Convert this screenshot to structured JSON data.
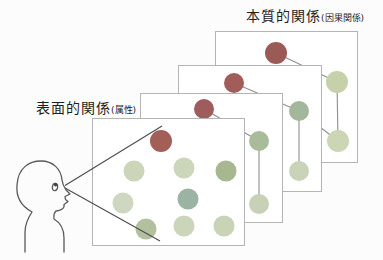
{
  "labels": {
    "back_title": "本質的関係",
    "back_title_note": "(因果関係)",
    "front_title": "表面的関係",
    "front_title_note": "(属性)"
  },
  "colors": {
    "background": "#fcfcfc",
    "card_bg": "#ffffff",
    "card_border": "#b4b4b4",
    "edge": "#8f8f8f",
    "cone": "#4f4f4f",
    "person_outline": "#5a5a5a",
    "text": "#1e1e1e",
    "node_dark_red": "#a25f58",
    "node_light_green": "#cbd5b9",
    "node_medium_green": "#a8bc99",
    "node_teal_green": "#9bb3a3"
  },
  "diagram": {
    "cards": [
      {
        "id": 4,
        "role": "deep-relations-card-back",
        "x": 215,
        "y": 31,
        "w": 143,
        "h": 132,
        "z": 1,
        "edges": [
          [
            60,
            21,
            121,
            50
          ],
          [
            121,
            50,
            122,
            109
          ],
          [
            104,
            95,
            122,
            109
          ]
        ],
        "dots": [
          [
            60,
            21,
            11,
            "#9a5a55"
          ],
          [
            121,
            50,
            11,
            "#c6d1ab"
          ],
          [
            122,
            109,
            11,
            "#ccd6b4"
          ]
        ]
      },
      {
        "id": 3,
        "role": "deep-relations-card",
        "x": 178,
        "y": 65,
        "w": 144,
        "h": 127,
        "z": 2,
        "edges": [
          [
            55,
            17,
            120,
            45
          ],
          [
            120,
            45,
            120,
            105
          ]
        ],
        "dots": [
          [
            55,
            17,
            10,
            "#a25d5a"
          ],
          [
            120,
            45,
            10,
            "#a3b79c"
          ],
          [
            120,
            105,
            10,
            "#c9d3b8"
          ]
        ]
      },
      {
        "id": 2,
        "role": "deep-relations-card",
        "x": 140,
        "y": 93,
        "w": 143,
        "h": 130,
        "z": 3,
        "edges": [
          [
            63,
            15,
            118,
            47
          ],
          [
            118,
            47,
            118,
            110
          ]
        ],
        "dots": [
          [
            63,
            15,
            10,
            "#9e5c5c"
          ],
          [
            118,
            47,
            10,
            "#a8bc99"
          ],
          [
            118,
            110,
            10,
            "#c6d1b6"
          ]
        ]
      },
      {
        "id": 1,
        "role": "surface-relations-card-front",
        "x": 92,
        "y": 118,
        "w": 153,
        "h": 128,
        "z": 4,
        "edges": [],
        "dots": [
          [
            68,
            22,
            11,
            "#a25f58"
          ],
          [
            41,
            52,
            10.5,
            "#cbd5b9"
          ],
          [
            91,
            49,
            10.5,
            "#ccd6bb"
          ],
          [
            133,
            52,
            10.5,
            "#a7b790"
          ],
          [
            30,
            84,
            10.5,
            "#ced8c0"
          ],
          [
            95,
            80,
            10.5,
            "#9bb3a3"
          ],
          [
            53,
            110,
            10.5,
            "#b2c09e"
          ],
          [
            91,
            107,
            10.5,
            "#cbd5b9"
          ],
          [
            131,
            107,
            10.5,
            "#c9d4b6"
          ]
        ]
      }
    ],
    "view_cone": {
      "lines": [
        [
          65,
          185.5,
          162,
          126
        ],
        [
          65,
          188,
          160,
          241
        ]
      ]
    }
  }
}
